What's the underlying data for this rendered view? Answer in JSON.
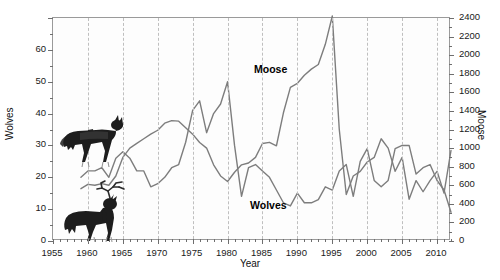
{
  "chart_data": {
    "type": "line",
    "title": "",
    "xlabel": "Year",
    "ylabel": "Wolves",
    "y2label": "Moose",
    "xlim": [
      1955,
      2012
    ],
    "ylim": [
      0,
      70
    ],
    "y2lim": [
      0,
      2400
    ],
    "grid": "vertical dashed gridlines every 5 years",
    "legend": "inline series labels",
    "annotations": [
      {
        "text": "Moose",
        "x": 1985,
        "y_axis": "right"
      },
      {
        "text": "Wolves",
        "x": 1984,
        "y_axis": "left"
      }
    ],
    "x_ticks": [
      1955,
      1960,
      1965,
      1970,
      1975,
      1980,
      1985,
      1990,
      1995,
      2000,
      2005,
      2010
    ],
    "y_ticks_left": [
      0,
      10,
      20,
      30,
      40,
      50,
      60
    ],
    "y_ticks_right": [
      0,
      200,
      400,
      600,
      800,
      1000,
      1200,
      1400,
      1600,
      1800,
      2000,
      2200,
      2400
    ],
    "series": [
      {
        "name": "Wolves",
        "axis": "left",
        "color": "#7d7d7d",
        "x": [
          1959,
          1960,
          1961,
          1962,
          1963,
          1964,
          1965,
          1966,
          1967,
          1968,
          1969,
          1970,
          1971,
          1972,
          1973,
          1974,
          1975,
          1976,
          1977,
          1978,
          1979,
          1980,
          1981,
          1982,
          1983,
          1984,
          1985,
          1986,
          1987,
          1988,
          1989,
          1990,
          1991,
          1992,
          1993,
          1994,
          1995,
          1996,
          1997,
          1998,
          1999,
          2000,
          2001,
          2002,
          2003,
          2004,
          2005,
          2006,
          2007,
          2008,
          2009,
          2010,
          2011,
          2012
        ],
        "values": [
          20,
          22,
          22,
          23,
          20,
          26,
          28,
          26,
          22,
          22,
          17,
          18,
          20,
          23,
          24,
          31,
          41,
          44,
          34,
          40,
          43,
          50,
          30,
          14,
          23,
          24,
          22,
          20,
          16,
          12,
          11,
          15,
          12,
          12,
          13,
          17,
          16,
          22,
          24,
          14,
          25,
          29,
          19,
          17,
          19,
          29,
          30,
          30,
          21,
          23,
          24,
          19,
          16,
          9
        ]
      },
      {
        "name": "Moose",
        "axis": "right",
        "color": "#7d7d7d",
        "x": [
          1959,
          1960,
          1961,
          1962,
          1963,
          1964,
          1965,
          1966,
          1967,
          1968,
          1969,
          1970,
          1971,
          1972,
          1973,
          1974,
          1975,
          1976,
          1977,
          1978,
          1979,
          1980,
          1981,
          1982,
          1983,
          1984,
          1985,
          1986,
          1987,
          1988,
          1989,
          1990,
          1991,
          1992,
          1993,
          1994,
          1995,
          1996,
          1997,
          1998,
          1999,
          2000,
          2001,
          2002,
          2003,
          2004,
          2005,
          2006,
          2007,
          2008,
          2009,
          2010,
          2011,
          2012
        ],
        "values": [
          563,
          610,
          600,
          617,
          600,
          700,
          900,
          1000,
          1050,
          1100,
          1150,
          1192,
          1268,
          1295,
          1290,
          1220,
          1150,
          1060,
          1000,
          820,
          700,
          640,
          740,
          820,
          840,
          900,
          1050,
          1062,
          1025,
          1380,
          1653,
          1697,
          1784,
          1850,
          1900,
          2117,
          2422,
          1200,
          500,
          700,
          750,
          850,
          900,
          1100,
          1000,
          750,
          900,
          450,
          650,
          530,
          650,
          750,
          515,
          975
        ]
      }
    ]
  },
  "axis_titles": {
    "left": "Wolves",
    "right": "Moose",
    "bottom": "Year"
  },
  "series_labels": {
    "moose": "Moose",
    "wolves": "Wolves"
  },
  "artwork": {
    "wolf": "wolf-illustration",
    "moose": "moose-illustration"
  }
}
